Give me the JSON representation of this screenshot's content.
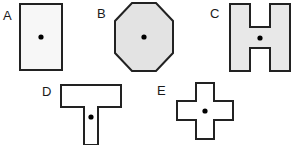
{
  "figure": {
    "background_color": "#ffffff",
    "outline_color": "#222222",
    "dot_color": "#000000",
    "shapes": [
      {
        "id": "a",
        "label": "A",
        "name": "rectangle",
        "fill_color": "#f7f7f7",
        "outline_color": "#222222",
        "stroke_width": 2,
        "has_center_dot": true,
        "dot_color": "#000000",
        "dot_radius": 2.6
      },
      {
        "id": "b",
        "label": "B",
        "name": "octagon",
        "fill_color": "#e3e3e3",
        "outline_color": "#222222",
        "stroke_width": 2,
        "has_center_dot": true,
        "dot_color": "#000000",
        "dot_radius": 2.6
      },
      {
        "id": "c",
        "label": "C",
        "name": "h-shape",
        "fill_color": "#e8e8e8",
        "outline_color": "#222222",
        "stroke_width": 2,
        "has_center_dot": true,
        "dot_color": "#000000",
        "dot_radius": 2.6
      },
      {
        "id": "d",
        "label": "D",
        "name": "t-shape",
        "fill_color": "#ffffff",
        "outline_color": "#222222",
        "stroke_width": 2,
        "has_center_dot": true,
        "dot_color": "#000000",
        "dot_radius": 2.6
      },
      {
        "id": "e",
        "label": "E",
        "name": "cross-shape",
        "fill_color": "#ffffff",
        "outline_color": "#222222",
        "stroke_width": 2,
        "has_center_dot": true,
        "dot_color": "#000000",
        "dot_radius": 2.6
      }
    ]
  }
}
